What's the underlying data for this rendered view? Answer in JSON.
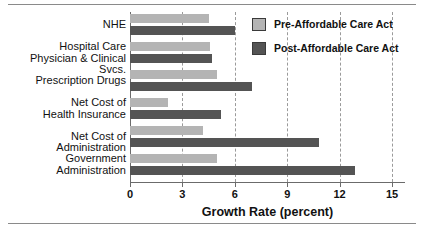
{
  "chart_data": {
    "type": "bar",
    "orientation": "horizontal",
    "title": "",
    "xlabel": "Growth Rate (percent)",
    "ylabel": "",
    "xlim": [
      0,
      15
    ],
    "xticks": [
      0,
      3,
      6,
      9,
      12,
      15
    ],
    "xticklabels": [
      "0",
      "3",
      "6",
      "9",
      "12",
      "15"
    ],
    "grid": "vertical-dashed",
    "legend_position": "top-right",
    "categories": [
      "NHE",
      "Hospital Care\nPhysician & Clinical Svcs.",
      "Prescription Drugs",
      "Net Cost of\nHealth Insurance",
      "Net Cost of Administration",
      "Government\nAdministration"
    ],
    "category_lines": [
      [
        "NHE"
      ],
      [
        "Hospital Care",
        "Physician & Clinical Svcs."
      ],
      [
        "Prescription Drugs"
      ],
      [
        "Net Cost of",
        "Health Insurance"
      ],
      [
        "Net Cost of Administration"
      ],
      [
        "Government",
        "Administration"
      ]
    ],
    "series": [
      {
        "name": "Pre-Affordable Care Act",
        "color": "#b4b4b4",
        "values": [
          4.5,
          4.6,
          5.0,
          2.2,
          4.2,
          5.0
        ]
      },
      {
        "name": "Post-Affordable Care Act",
        "color": "#545454",
        "values": [
          6.0,
          4.7,
          7.0,
          5.2,
          10.8,
          12.9
        ]
      }
    ]
  },
  "legend": {
    "items": [
      {
        "label": "Pre-Affordable Care Act",
        "swatch": "pre"
      },
      {
        "label": "Post-Affordable Care Act",
        "swatch": "post"
      }
    ]
  },
  "axis": {
    "title": "Growth Rate (percent)"
  }
}
